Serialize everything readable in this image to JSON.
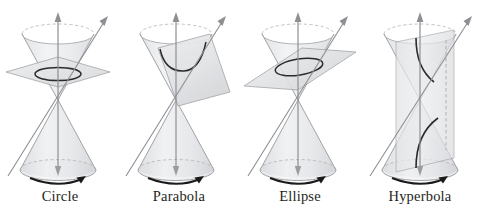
{
  "figure": {
    "background_color": "#ffffff",
    "width": 482,
    "height": 217
  },
  "style": {
    "outline_color": "#8d8f93",
    "cone_fill_color": "#e9eaec",
    "plane_fill_color": "#e4e5e7",
    "plane_edge_color": "#9a9c9f",
    "curve_color": "#2b2b2b",
    "axis_color": "#8d8f93",
    "dashed_color": "#a7a9ac",
    "caption_color": "#231f20"
  },
  "panels": [
    {
      "id": "circle",
      "label": "Circle",
      "conic": "circle",
      "plane_orientation": "horizontal, perpendicular to the cone axis",
      "axis_label": "vertical axis arrow",
      "rotation_arrow": "counterclockwise rotation arc at cone base",
      "generator_label": "slanted generating line arrow"
    },
    {
      "id": "parabola",
      "label": "Parabola",
      "conic": "parabola",
      "plane_orientation": "tilted parallel to a generating line of the cone",
      "axis_label": "vertical axis arrow",
      "rotation_arrow": "counterclockwise rotation arc at cone base",
      "generator_label": "slanted generating line arrow"
    },
    {
      "id": "ellipse",
      "label": "Ellipse",
      "conic": "ellipse",
      "plane_orientation": "oblique, cutting one nappe completely",
      "axis_label": "vertical axis arrow",
      "rotation_arrow": "counterclockwise rotation arc at cone base",
      "generator_label": "slanted generating line arrow"
    },
    {
      "id": "hyperbola",
      "label": "Hyperbola",
      "conic": "hyperbola",
      "plane_orientation": "vertical, parallel to the cone axis, cutting both nappes",
      "axis_label": "vertical axis arrow",
      "rotation_arrow": "counterclockwise rotation arc at cone base",
      "generator_label": "slanted generating line arrow"
    }
  ]
}
